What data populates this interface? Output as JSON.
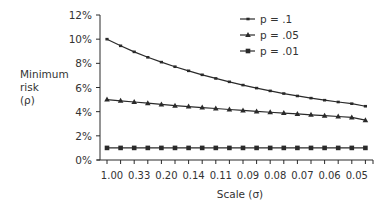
{
  "chart_data": {
    "type": "line",
    "title": "",
    "xlabel": "Scale (σ)",
    "ylabel": [
      "Minimum",
      "risk",
      "(ρ)"
    ],
    "ylim": [
      0,
      12
    ],
    "yticks": [
      "0%",
      "2%",
      "4%",
      "6%",
      "8%",
      "10%",
      "12%"
    ],
    "x_tick_labels": [
      "1.00",
      "0.33",
      "0.20",
      "0.14",
      "0.11",
      "0.09",
      "0.08",
      "0.07",
      "0.06",
      "0.05"
    ],
    "x_points": 20,
    "grid": false,
    "legend_position": "top-right",
    "series": [
      {
        "name": "p = .1",
        "marker": "small-square",
        "values": [
          10.0,
          9.45,
          8.95,
          8.5,
          8.1,
          7.72,
          7.38,
          7.05,
          6.75,
          6.47,
          6.2,
          5.95,
          5.72,
          5.5,
          5.3,
          5.12,
          4.95,
          4.8,
          4.66,
          4.45
        ]
      },
      {
        "name": "p = .05",
        "marker": "triangle",
        "values": [
          5.0,
          4.9,
          4.8,
          4.7,
          4.6,
          4.5,
          4.42,
          4.34,
          4.26,
          4.18,
          4.1,
          4.02,
          3.95,
          3.88,
          3.81,
          3.74,
          3.67,
          3.6,
          3.52,
          3.3
        ]
      },
      {
        "name": "p = .01",
        "marker": "square",
        "values": [
          1.0,
          1.0,
          1.0,
          1.0,
          1.0,
          1.0,
          1.0,
          1.0,
          1.0,
          1.0,
          1.0,
          1.0,
          1.0,
          1.0,
          1.0,
          1.0,
          1.0,
          1.0,
          1.0,
          1.0
        ]
      }
    ]
  },
  "colors": {
    "line": "#2a2a2a",
    "axis": "#2a2a2a",
    "text": "#333333"
  }
}
